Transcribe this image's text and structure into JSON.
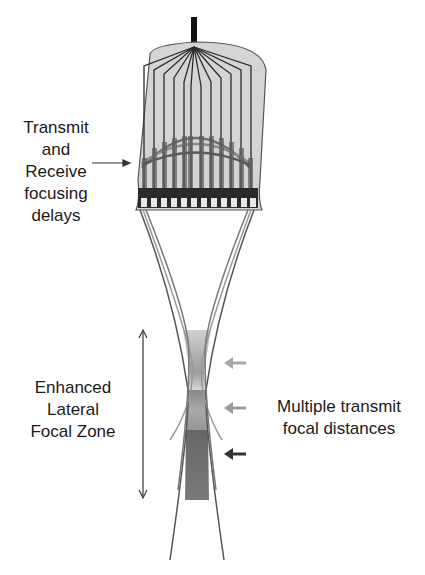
{
  "labels": {
    "delays": [
      "Transmit",
      "and",
      "Receive",
      "focusing",
      "delays"
    ],
    "zone": [
      "Enhanced",
      "Lateral",
      "Focal Zone"
    ],
    "focal": [
      "Multiple transmit",
      "focal distances"
    ]
  },
  "colors": {
    "housing_fill": "#d4d4d4",
    "housing_stroke": "#555555",
    "wire": "#2b2b2b",
    "arrow_light": "#a8a8a8",
    "arrow_mid": "#9a9a9a",
    "arrow_dark": "#333333"
  },
  "elements": {
    "count": 12
  }
}
